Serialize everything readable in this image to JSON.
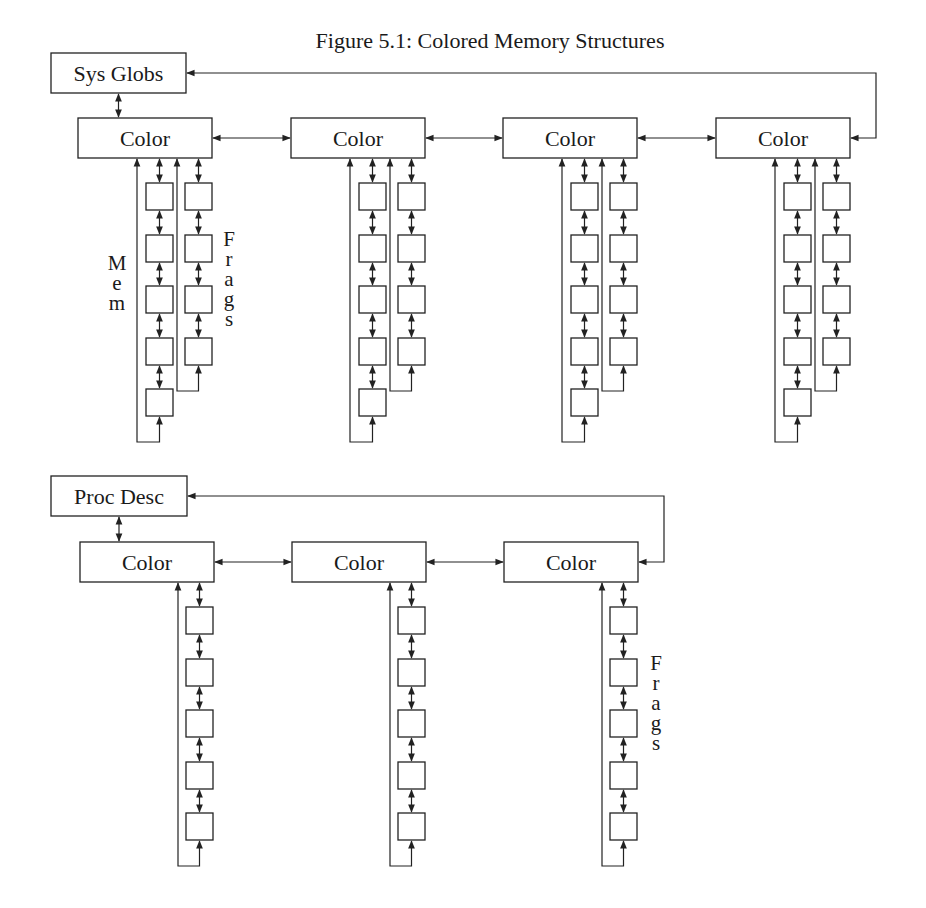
{
  "title": "Figure 5.1: Colored Memory Structures",
  "colors": {
    "stroke": "#222222",
    "background": "#ffffff",
    "text": "#1a1a1a"
  },
  "diagrams": [
    {
      "name": "sys-globs-structure",
      "root": {
        "label": "Sys Globs",
        "x": 51,
        "y": 53,
        "w": 135,
        "h": 40
      },
      "color_row_y": 118,
      "color_box": {
        "w": 134,
        "h": 40
      },
      "color_boxes": [
        {
          "label": "Color",
          "x": 78,
          "mem_count": 5,
          "frags_count": 4
        },
        {
          "label": "Color",
          "x": 291,
          "mem_count": 5,
          "frags_count": 4
        },
        {
          "label": "Color",
          "x": 503,
          "mem_count": 5,
          "frags_count": 4
        },
        {
          "label": "Color",
          "x": 716,
          "mem_count": 5,
          "frags_count": 4
        }
      ],
      "return_loop": {
        "x": 876,
        "top_y": 73
      },
      "side_labels": [
        {
          "text": "Mem",
          "x": 117,
          "y": 270
        },
        {
          "text": "Frags",
          "x": 229,
          "y": 246
        }
      ]
    },
    {
      "name": "proc-desc-structure",
      "root": {
        "label": "Proc Desc",
        "x": 51,
        "y": 476,
        "w": 136,
        "h": 40
      },
      "color_row_y": 542,
      "color_box": {
        "w": 134,
        "h": 40
      },
      "color_boxes": [
        {
          "label": "Color",
          "x": 80,
          "mem_count": 0,
          "frags_count": 5
        },
        {
          "label": "Color",
          "x": 292,
          "mem_count": 0,
          "frags_count": 5
        },
        {
          "label": "Color",
          "x": 504,
          "mem_count": 0,
          "frags_count": 5
        }
      ],
      "return_loop": {
        "x": 664,
        "top_y": 497
      },
      "side_labels": [
        {
          "text": "Frags",
          "x": 656,
          "y": 670
        }
      ]
    }
  ],
  "chain_layout": {
    "node_w": 27,
    "node_h": 27,
    "first_node_gap": 25,
    "node_pitch": 51.5,
    "mem_loop_dx": 59,
    "mem_node_dx": 68,
    "frags_loop_dx": 99,
    "frags_node_dx": 107,
    "loop_tail": 26
  }
}
